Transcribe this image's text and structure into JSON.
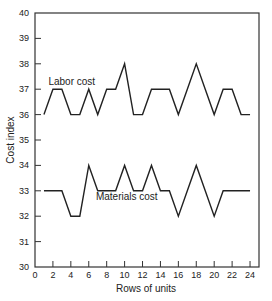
{
  "chart_data": {
    "type": "line",
    "title": "",
    "xlabel": "Rows of units",
    "ylabel": "Cost index",
    "xlim": [
      0,
      25
    ],
    "ylim": [
      30,
      40
    ],
    "xticks": [
      0,
      2,
      4,
      6,
      8,
      10,
      12,
      14,
      16,
      18,
      20,
      22,
      24
    ],
    "yticks": [
      30,
      31,
      32,
      33,
      34,
      35,
      36,
      37,
      38,
      39,
      40
    ],
    "grid": false,
    "legend": "inline labels",
    "x": [
      1,
      2,
      3,
      4,
      5,
      6,
      7,
      8,
      9,
      10,
      11,
      12,
      13,
      14,
      15,
      16,
      17,
      18,
      19,
      20,
      21,
      22,
      23,
      24
    ],
    "series": [
      {
        "name": "Labor cost",
        "values": [
          36,
          37,
          37,
          36,
          36,
          37,
          36,
          37,
          37,
          38,
          36,
          36,
          37,
          37,
          37,
          36,
          37,
          38,
          37,
          36,
          37,
          37,
          36,
          36
        ],
        "label_pos": [
          1.5,
          37.15
        ]
      },
      {
        "name": "Materials cost",
        "values": [
          33,
          33,
          33,
          32,
          32,
          34,
          33,
          33,
          33,
          34,
          33,
          33,
          34,
          33,
          33,
          32,
          33,
          34,
          33,
          32,
          33,
          33,
          33,
          33
        ],
        "label_pos": [
          6.8,
          32.65
        ]
      }
    ]
  }
}
